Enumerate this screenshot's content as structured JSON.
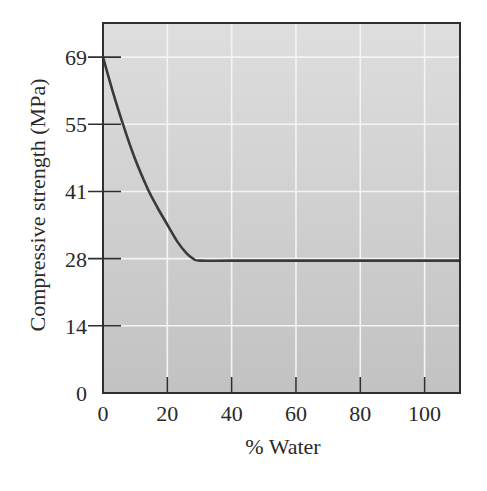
{
  "chart_data": {
    "type": "line",
    "title": "",
    "xlabel": "% Water",
    "ylabel": "Compressive strength (MPa)",
    "xlim": [
      0,
      111
    ],
    "ylim": [
      0,
      76
    ],
    "grid": true,
    "legend": null,
    "x_ticks": [
      0,
      20,
      40,
      60,
      80,
      100
    ],
    "x_tick_labels": [
      "0",
      "20",
      "40",
      "60",
      "80",
      "100"
    ],
    "y_ticks": [
      0,
      13.8,
      27.6,
      41.4,
      55.2,
      69
    ],
    "y_tick_labels": [
      "0",
      "14",
      "28",
      "41",
      "55",
      "69"
    ],
    "series": [
      {
        "name": "Compressive strength",
        "color": "#3a3a3a",
        "x": [
          0,
          3,
          6.3,
          10,
          14,
          17,
          20,
          23,
          26,
          28,
          30,
          40,
          60,
          80,
          100,
          111
        ],
        "y": [
          69,
          62,
          55,
          48,
          41.8,
          38,
          34.6,
          31.2,
          28.7,
          27.6,
          27.2,
          27.2,
          27.2,
          27.2,
          27.2,
          27.2
        ]
      }
    ]
  },
  "style": {
    "plot_bg_top": "#dedede",
    "plot_bg_bottom": "#c2c2c2",
    "grid_color": "#f4f4f4",
    "axis_color": "#2f2f2f",
    "line_color": "#3a3a3a"
  }
}
